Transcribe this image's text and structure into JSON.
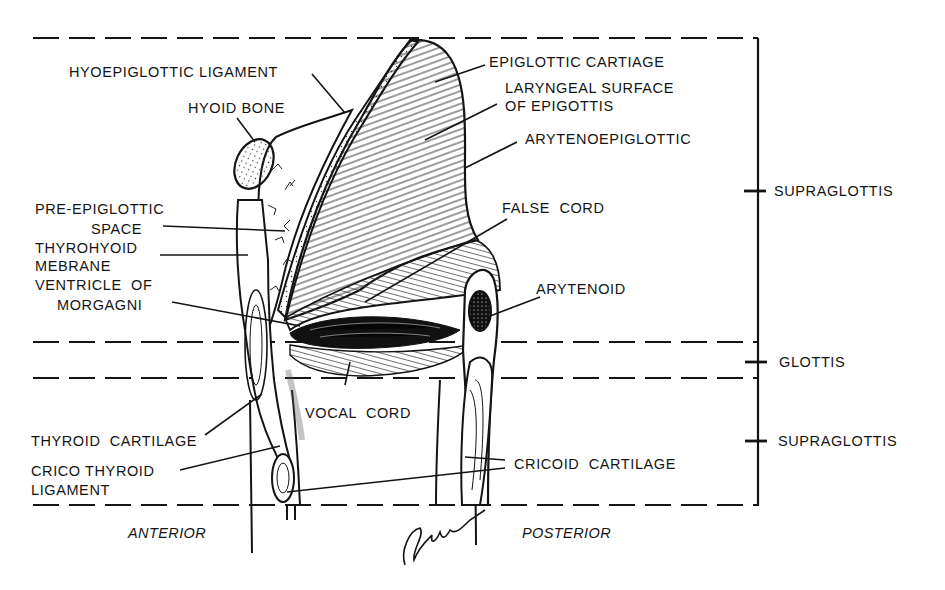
{
  "diagram": {
    "colors": {
      "ink": "#141414",
      "background": "#ffffff"
    },
    "labels_left": [
      {
        "id": "hyoepiglottic-ligament",
        "text": "HYOEPIGLOTTIC LIGAMENT"
      },
      {
        "id": "hyoid-bone",
        "text": "HYOID BONE"
      },
      {
        "id": "pre-epiglottic-space-1",
        "text": "PRE-EPIGLOTTIC"
      },
      {
        "id": "pre-epiglottic-space-2",
        "text": "SPACE"
      },
      {
        "id": "thyrohyoid-membrane-1",
        "text": "THYROHYOID"
      },
      {
        "id": "thyrohyoid-membrane-2",
        "text": "MEBRANE"
      },
      {
        "id": "ventricle-1",
        "text": "VENTRICLE  OF"
      },
      {
        "id": "ventricle-2",
        "text": "MORGAGNI"
      },
      {
        "id": "thyroid-cartilage",
        "text": "THYROID  CARTILAGE"
      },
      {
        "id": "cricothyroid-1",
        "text": "CRICO THYROID"
      },
      {
        "id": "cricothyroid-2",
        "text": "LIGAMENT"
      }
    ],
    "labels_right": [
      {
        "id": "epiglottic-cartilage",
        "text": "EPIGLOTTIC CARTIAGE"
      },
      {
        "id": "laryngeal-surface-1",
        "text": "LARYNGEAL SURFACE"
      },
      {
        "id": "laryngeal-surface-2",
        "text": "OF EPIGOTTIS"
      },
      {
        "id": "aryepiglottic",
        "text": "ARYTENOEPIGLOTTIC"
      },
      {
        "id": "false-cord",
        "text": "FALSE  CORD"
      },
      {
        "id": "arytenoid",
        "text": "ARYTENOID"
      },
      {
        "id": "cricoid-cartilage",
        "text": "CRICOID  CARTILAGE"
      }
    ],
    "labels_center": [
      {
        "id": "vocal-cord",
        "text": "VOCAL  CORD"
      }
    ],
    "regions": [
      {
        "id": "supraglottis-upper",
        "text": "SUPRAGLOTTIS"
      },
      {
        "id": "glottis",
        "text": "GLOTTIS"
      },
      {
        "id": "supraglottis-lower",
        "text": "SUPRAGLOTTIS"
      }
    ],
    "orientation": {
      "anterior": "ANTERIOR",
      "posterior": "POSTERIOR"
    },
    "signature": "Gallo"
  }
}
